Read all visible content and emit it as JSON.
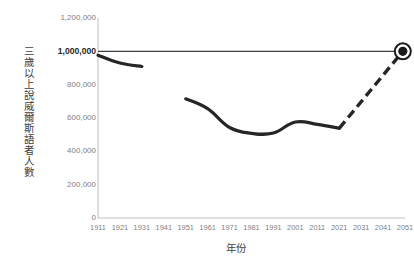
{
  "chart_data": {
    "type": "line",
    "title": "",
    "xlabel": "年份",
    "ylabel": "三歲以上說威爾斯語者人數",
    "x": [
      1911,
      1921,
      1931,
      1941,
      1951,
      1961,
      1971,
      1981,
      1991,
      2001,
      2011,
      2021,
      2031,
      2041,
      2051
    ],
    "xtick_labels": [
      "1911",
      "1921",
      "1931",
      "1941",
      "1951",
      "1961",
      "1971",
      "1981",
      "1991",
      "2001",
      "2011",
      "2021",
      "2031",
      "2041",
      "2051"
    ],
    "ytick_labels": [
      "1,200,000",
      "1,000,000",
      "800,000",
      "600,000",
      "400,000",
      "200,000",
      "0"
    ],
    "ytick_values": [
      1200000,
      1000000,
      800000,
      600000,
      400000,
      200000,
      0
    ],
    "ylim": [
      0,
      1200000
    ],
    "xlim": [
      1911,
      2051
    ],
    "grid": false,
    "legend": "none",
    "emphasized_ytick": "1,000,000",
    "series": [
      {
        "name": "歷史數據 (1911-1931)",
        "style": "solid",
        "x": [
          1911,
          1921,
          1931
        ],
        "values": [
          977000,
          930000,
          909000
        ]
      },
      {
        "name": "歷史數據 (1951-2021)",
        "style": "solid",
        "x": [
          1951,
          1961,
          1971,
          1981,
          1991,
          2001,
          2011,
          2021
        ],
        "values": [
          715000,
          656000,
          543000,
          508000,
          510000,
          576000,
          562000,
          538000
        ]
      },
      {
        "name": "預測 (2021-2050)",
        "style": "dashed",
        "x": [
          2021,
          2050
        ],
        "values": [
          538000,
          1000000
        ]
      }
    ],
    "reference_line": {
      "name": "百萬人目標線",
      "value": 1000000,
      "label": "1,000,000",
      "style": "solid"
    },
    "marker": {
      "name": "目標點",
      "x": 2050,
      "y": 1000000,
      "shape": "circle-ringed"
    },
    "colors": {
      "line": "#262626",
      "reference_line": "#404040",
      "axis": "#bfbfbf",
      "tick_text": "#7f7f7f",
      "title_text": "#3f3f3f",
      "background": "#ffffff"
    }
  }
}
